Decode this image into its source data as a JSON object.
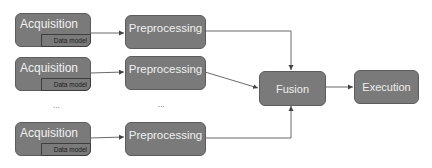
{
  "diagram": {
    "acquisition": [
      {
        "label": "Acquisition",
        "sub_label": "Data model"
      },
      {
        "label": "Acquisition",
        "sub_label": "Data model"
      },
      {
        "label": "Acquisition",
        "sub_label": "Data model"
      }
    ],
    "preprocessing": [
      {
        "label": "Preprocessing"
      },
      {
        "label": "Preprocessing"
      },
      {
        "label": "Preprocessing"
      }
    ],
    "ellipsis_left": "...",
    "ellipsis_right": "...",
    "fusion": {
      "label": "Fusion"
    },
    "execution": {
      "label": "Execution"
    },
    "colors": {
      "box_fill": "#7a7a7a",
      "box_border": "#5c5c5c",
      "box_text": "#f0f0f0",
      "sub_text": "#1e1e1e",
      "arrow": "#444444"
    }
  }
}
